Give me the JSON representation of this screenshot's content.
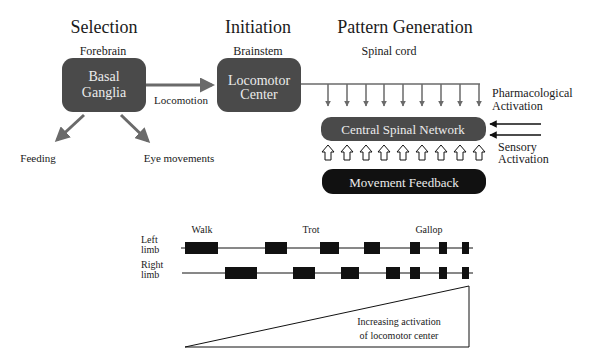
{
  "stages": {
    "selection": "Selection",
    "initiation": "Initiation",
    "pattern_generation": "Pattern Generation"
  },
  "regions": {
    "forebrain": "Forebrain",
    "brainstem": "Brainstem",
    "spinal_cord": "Spinal cord"
  },
  "boxes": {
    "basal_ganglia": [
      "Basal",
      "Ganglia"
    ],
    "locomotor_center": [
      "Locomotor",
      "Center"
    ],
    "central_spinal_network": "Central Spinal Network",
    "movement_feedback": "Movement Feedback"
  },
  "arrow_labels": {
    "locomotion": "Locomotion",
    "feeding": "Feeding",
    "eye_movements": "Eye movements",
    "pharmacological": [
      "Pharmacological",
      "Activation"
    ],
    "sensory": [
      "Sensory",
      "Activation"
    ]
  },
  "gait": {
    "labels": {
      "walk": "Walk",
      "trot": "Trot",
      "gallop": "Gallop"
    },
    "rows": [
      {
        "label": [
          "Left",
          "limb"
        ],
        "bars": [
          [
            183,
            217
          ],
          [
            264,
            287
          ],
          [
            320,
            338
          ],
          [
            363,
            380
          ],
          [
            410,
            420
          ],
          [
            438,
            447
          ],
          [
            462,
            469
          ]
        ]
      },
      {
        "label": [
          "Right",
          "limb"
        ],
        "bars": [
          [
            225,
            257
          ],
          [
            293,
            314
          ],
          [
            341,
            359
          ],
          [
            385,
            400
          ],
          [
            410,
            420
          ],
          [
            438,
            447
          ],
          [
            462,
            469
          ]
        ]
      }
    ],
    "ramp_label": [
      "Increasing activation",
      "of locomotor center"
    ]
  },
  "colors": {
    "box_dark": "#4a4a4a",
    "box_black": "#111111",
    "arrow_gray": "#6a6a6a",
    "text": "#1a1a1a"
  }
}
